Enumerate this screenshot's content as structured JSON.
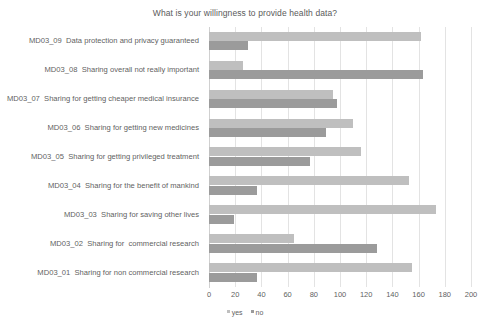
{
  "chart_data": {
    "type": "bar",
    "orientation": "horizontal",
    "title": "What is your willingness to provide health data?",
    "xlabel": "",
    "ylabel": "",
    "xlim": [
      0,
      200
    ],
    "xticks": [
      0,
      20,
      40,
      60,
      80,
      100,
      120,
      140,
      160,
      180,
      200
    ],
    "grid": true,
    "grid_axis": "x",
    "legend_position": "bottom",
    "categories": [
      "MD03_09  Data protection and privacy guaranteed",
      "MD03_08  Sharing overall not really important",
      "MD03_07  Sharing for getting cheaper medical insurance",
      "MD03_06  Sharing for getting new medicines",
      "MD03_05  Sharing for getting privileged treatment",
      "MD03_04  Sharing for the benefit of mankind",
      "MD03_03  Sharing for saving other lives",
      "MD03_02  Sharing for  commercial research",
      "MD03_01  Sharing for non commercial research"
    ],
    "series": [
      {
        "name": "yes",
        "color": "#bfbfbf",
        "values": [
          162,
          26,
          95,
          110,
          116,
          153,
          173,
          65,
          155
        ]
      },
      {
        "name": "no",
        "color": "#9b9b9b",
        "values": [
          30,
          163,
          98,
          89,
          77,
          37,
          19,
          128,
          37
        ]
      }
    ]
  },
  "legend": {
    "items": [
      {
        "label": "yes",
        "color": "#bfbfbf"
      },
      {
        "label": "no",
        "color": "#9b9b9b"
      }
    ]
  }
}
